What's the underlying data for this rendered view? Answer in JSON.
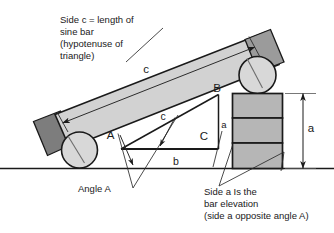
{
  "diagram": {
    "colors": {
      "bar_fill": "#d2d2d2",
      "bar_edge": "#1a1a1a",
      "endcap_fill": "#7d7d7d",
      "roller_fill": "#d8d8d8",
      "gauge_block_fill": "#b6b6b6",
      "line": "#1a1a1a",
      "thin_line": "#4a4a4a",
      "text": "#1a1a1a"
    },
    "notes": {
      "side_c": {
        "line1": "Side c = length of",
        "line2": "sine bar",
        "line3": "(hypotenuse of",
        "line4": "triangle)"
      },
      "angle_a": {
        "line1": "Angle A"
      },
      "side_a": {
        "line1": "Side a Is the",
        "line2": "bar elevation",
        "line3": "(side a opposite angle A)"
      }
    },
    "labels": {
      "c_dimension": "c",
      "c_triangle": "c",
      "b_triangle": "b",
      "a_blocks": "a",
      "a_dimension": "a",
      "vertex_a": "A",
      "vertex_b": "B",
      "vertex_c": "C"
    },
    "parts": {
      "sine_bar": "sine-bar",
      "left_roller": "left-roller",
      "right_roller": "right-roller",
      "left_endcap": "left-endcap",
      "right_endcap": "right-endcap",
      "gauge_block_count": 3,
      "ground_line": "ground-reference-line"
    }
  }
}
